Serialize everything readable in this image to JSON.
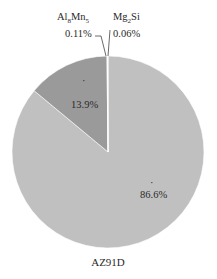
{
  "chart_data": {
    "type": "pie",
    "title": "AZ91D",
    "slices": [
      {
        "name": "",
        "value": 86.6,
        "label": "86.6%",
        "color": "#c0c0c0"
      },
      {
        "name": "",
        "value": 13.9,
        "label": "13.9%",
        "color": "#9a9a9a"
      },
      {
        "name": "Al8Mn5",
        "name_display": {
          "base": "Al",
          "sub1": "8",
          "mid": "Mn",
          "sub2": "5"
        },
        "value": 0.11,
        "label": "0.11%",
        "color": "#ededed"
      },
      {
        "name": "Mg2Si",
        "name_display": {
          "base": "Mg",
          "sub1": "2",
          "mid": "Si",
          "sub2": ""
        },
        "value": 0.06,
        "label": "0.06%",
        "color": "#ffffff"
      }
    ],
    "legend": "none",
    "grid": false
  }
}
